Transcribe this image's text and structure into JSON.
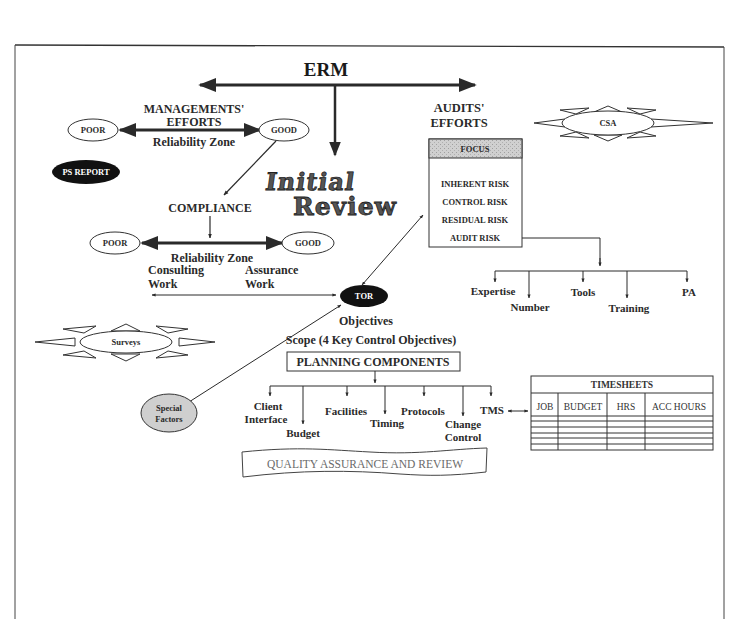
{
  "diagram": {
    "title": "ERM",
    "management": {
      "heading_line1": "MANAGEMENTS'",
      "heading_line2": "EFFORTS",
      "poor": "POOR",
      "good": "GOOD",
      "zone": "Reliability Zone"
    },
    "ps_report": "PS REPORT",
    "initial_review": {
      "line1": "Initial",
      "line2": "Review"
    },
    "compliance": {
      "label": "COMPLIANCE",
      "poor": "POOR",
      "good": "GOOD",
      "zone": "Reliability Zone",
      "consulting_line1": "Consulting",
      "consulting_line2": "Work",
      "assurance_line1": "Assurance",
      "assurance_line2": "Work"
    },
    "audits": {
      "heading_line1": "AUDITS'",
      "heading_line2": "EFFORTS",
      "focus_header": "FOCUS",
      "focus_items": [
        "INHERENT RISK",
        "CONTROL RISK",
        "RESIDUAL RISK",
        "AUDIT RISK"
      ],
      "resources": [
        "Expertise",
        "Number",
        "Tools",
        "Training",
        "PA"
      ]
    },
    "csa": "CSA",
    "surveys": "Surveys",
    "tor": {
      "label": "TOR",
      "objectives": "Objectives",
      "scope": "Scope (4 Key Control Objectives)"
    },
    "special_factors": {
      "line1": "Special",
      "line2": "Factors"
    },
    "planning": {
      "title": "PLANNING COMPONENTS",
      "components": [
        {
          "line1": "Client",
          "line2": "Interface"
        },
        {
          "line1": "Budget",
          "line2": ""
        },
        {
          "line1": "Facilities",
          "line2": ""
        },
        {
          "line1": "Timing",
          "line2": ""
        },
        {
          "line1": "Protocols",
          "line2": ""
        },
        {
          "line1": "Change",
          "line2": "Control"
        },
        {
          "line1": "TMS",
          "line2": ""
        }
      ]
    },
    "quality_assurance": "QUALITY ASSURANCE AND REVIEW",
    "timesheets": {
      "title": "TIMESHEETS",
      "columns": [
        "JOB",
        "BUDGET",
        "HRS",
        "ACC HOURS"
      ],
      "empty_rows": 5
    },
    "colors": {
      "line": "#2a2a2a",
      "focus_header_fill": "#c8c8c8",
      "special_factors_fill": "#cfcfcf",
      "dark_ellipse_fill": "#111111",
      "qa_text": "#6a6a6a"
    }
  }
}
